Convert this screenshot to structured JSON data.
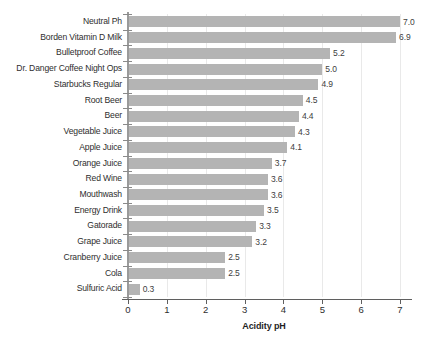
{
  "chart_data": {
    "type": "bar",
    "orientation": "horizontal",
    "title": "",
    "subtitle": "",
    "xlabel": "Acidity pH",
    "ylabel": "",
    "xlim": [
      0,
      7
    ],
    "xticks": [
      "0",
      "1",
      "2",
      "3",
      "4",
      "5",
      "6",
      "7"
    ],
    "grid": true,
    "legend": false,
    "bar_color": "#b4b4b4",
    "categories": [
      "Neutral Ph",
      "Borden Vitamin D Milk",
      "Bulletproof Coffee",
      "Dr. Danger Coffee Night Ops",
      "Starbucks Regular",
      "Root Beer",
      "Beer",
      "Vegetable Juice",
      "Apple Juice",
      "Orange Juice",
      "Red Wine",
      "Mouthwash",
      "Energy Drink",
      "Gatorade",
      "Grape Juice",
      "Cranberry Juice",
      "Cola",
      "Sulfuric Acid"
    ],
    "values": [
      7.0,
      6.9,
      5.2,
      5.0,
      4.9,
      4.5,
      4.4,
      4.3,
      4.1,
      3.7,
      3.6,
      3.6,
      3.5,
      3.3,
      3.2,
      2.5,
      2.5,
      0.3
    ],
    "value_labels": [
      "7.0",
      "6.9",
      "5.2",
      "5.0",
      "4.9",
      "4.5",
      "4.4",
      "4.3",
      "4.1",
      "3.7",
      "3.6",
      "3.6",
      "3.5",
      "3.3",
      "3.2",
      "2.5",
      "2.5",
      "0.3"
    ]
  }
}
